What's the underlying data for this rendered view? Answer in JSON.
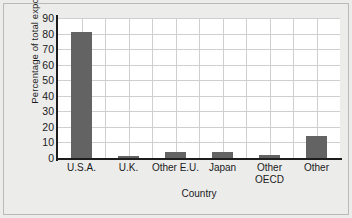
{
  "chart_data": {
    "type": "bar",
    "title": "",
    "xlabel": "Country",
    "ylabel": "Percentage of total exports",
    "categories": [
      "U.S.A.",
      "U.K.",
      "Other E.U.",
      "Japan",
      "Other OECD",
      "Other"
    ],
    "values": [
      81,
      1.5,
      4,
      4,
      2,
      14
    ],
    "ylim": [
      0,
      90
    ],
    "yticks": [
      0,
      10,
      20,
      30,
      40,
      50,
      60,
      70,
      80,
      90
    ],
    "ytick_labels": [
      "0",
      "10",
      "20",
      "30",
      "40",
      "50",
      "60",
      "70",
      "80",
      "90"
    ],
    "grid": "both",
    "legend": "none",
    "bar_color": "#636363",
    "plot_background": "#ffffff",
    "figure_background": "#ececeb",
    "axis_color": "#1c1c1c",
    "grid_color": "#cfcfcf"
  }
}
